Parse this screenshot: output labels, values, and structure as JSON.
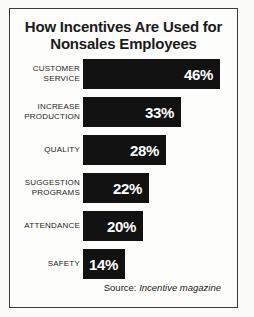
{
  "figure": {
    "title_line_1": "How Incentives Are Used for",
    "title_line_2": "Nonsales Employees",
    "source_prefix": "Source:",
    "source_name": "Incentive magazine",
    "bar_color": "#121212",
    "value_text_color": "#ffffff",
    "background_color": "#fdfdfb",
    "border_color": "#3a3a3a"
  },
  "chart_data": {
    "type": "bar",
    "orientation": "horizontal",
    "title": "How Incentives Are Used for Nonsales Employees",
    "xlabel": "",
    "ylabel": "",
    "xlim": [
      0,
      50
    ],
    "grid": false,
    "legend": null,
    "value_suffix": "%",
    "categories": [
      "CUSTOMER SERVICE",
      "INCREASE PRODUCTION",
      "QUALITY",
      "SUGGESTION PROGRAMS",
      "ATTENDANCE",
      "SAFETY"
    ],
    "values": [
      46,
      33,
      28,
      22,
      20,
      14
    ],
    "bars": [
      {
        "label_line_1": "CUSTOMER",
        "label_line_2": "SERVICE",
        "value": 46,
        "value_label": "46%"
      },
      {
        "label_line_1": "INCREASE",
        "label_line_2": "PRODUCTION",
        "value": 33,
        "value_label": "33%"
      },
      {
        "label_line_1": "QUALITY",
        "label_line_2": "",
        "value": 28,
        "value_label": "28%"
      },
      {
        "label_line_1": "SUGGESTION",
        "label_line_2": "PROGRAMS",
        "value": 22,
        "value_label": "22%"
      },
      {
        "label_line_1": "ATTENDANCE",
        "label_line_2": "",
        "value": 20,
        "value_label": "20%"
      },
      {
        "label_line_1": "SAFETY",
        "label_line_2": "",
        "value": 14,
        "value_label": "14%"
      }
    ]
  }
}
